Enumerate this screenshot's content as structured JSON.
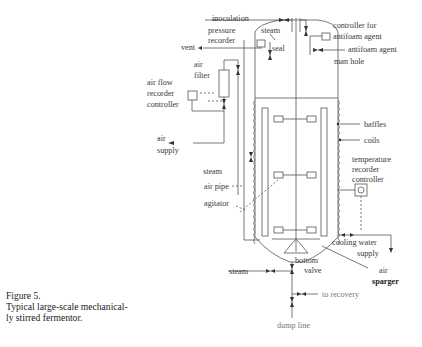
{
  "figure": {
    "number_label": "Figure 5.",
    "caption_line1": "Typical large-scale mechanical-",
    "caption_line2": "ly stirred fermentor."
  },
  "labels": {
    "inoculation": "inoculation",
    "pressure_recorder_1": "pressure",
    "pressure_recorder_2": "recorder",
    "steam_top": "steam",
    "controller_antifoam_1": "controller for",
    "controller_antifoam_2": "antifoam agent",
    "antifoam_agent": "antifoam agent",
    "vent": "vent",
    "seal": "seal",
    "man_hole": "man hole",
    "air_filter_1": "air",
    "air_filter_2": "filter",
    "air_flow_1": "air flow",
    "air_flow_2": "recorder",
    "air_flow_3": "controller",
    "baffles": "baffles",
    "coils": "coils",
    "air_supply_1": "air",
    "air_supply_2": "supply",
    "steam_mid": "steam",
    "temp_1": "temperature",
    "temp_2": "recorder",
    "temp_3": "controller",
    "air_pipe": "air pipe",
    "agitator": "agitator",
    "cooling_water_1": "cooling water",
    "cooling_water_2": "supply",
    "bottom_valve_1": "bottom",
    "bottom_valve_2": "valve",
    "steam_bottom": "steam",
    "air_sparger_1": "air",
    "air_sparger_2": "sparger",
    "to_recovery": "to recovery",
    "dump_line": "dump line"
  }
}
